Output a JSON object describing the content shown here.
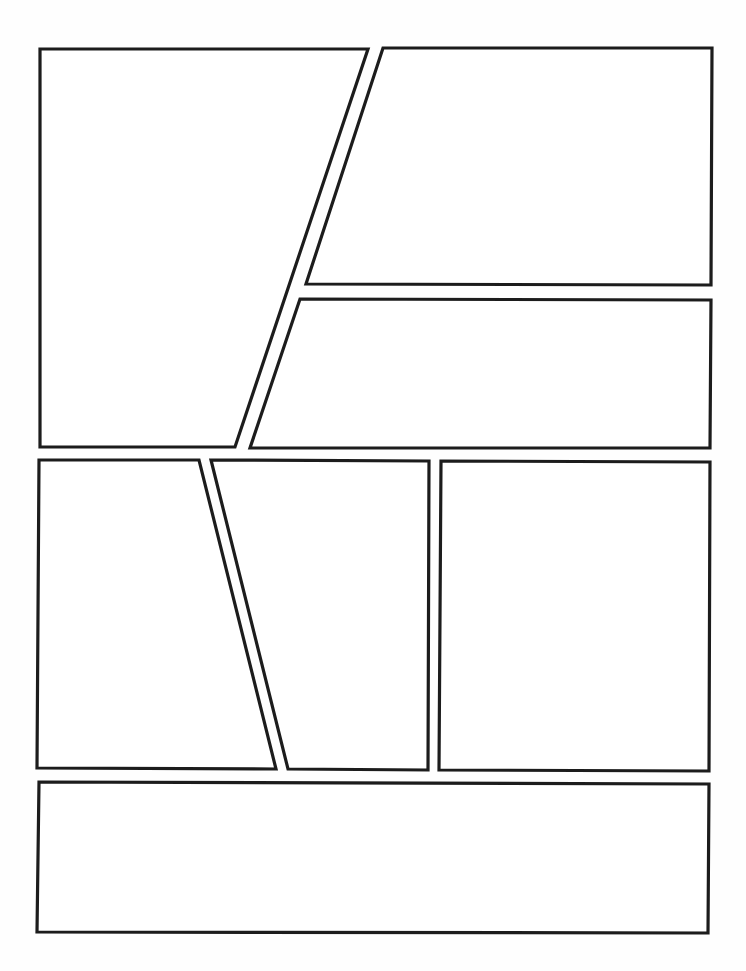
{
  "page": {
    "type": "comic-page-layout-template",
    "width": 746,
    "height": 971,
    "background": "#ffffff",
    "border_color": "#1c1c1c",
    "border_width": 3,
    "panel_count": 7
  },
  "panels": [
    {
      "id": "panel-1",
      "row": 1,
      "points": "40,49 368,49 235,447 40,447"
    },
    {
      "id": "panel-2",
      "row": 1,
      "points": "383,48 712,48 711,285 306,284"
    },
    {
      "id": "panel-3",
      "row": 1,
      "points": "300,299 711,300 710,448 250,448"
    },
    {
      "id": "panel-4",
      "row": 2,
      "points": "39,460 199,460 276,769 37,768"
    },
    {
      "id": "panel-5",
      "row": 2,
      "points": "211,460 429,461 428,770 288,769"
    },
    {
      "id": "panel-6",
      "row": 2,
      "points": "441,461 710,462 709,771 439,770"
    },
    {
      "id": "panel-7",
      "row": 3,
      "points": "39,782 709,784 708,933 37,932"
    }
  ]
}
